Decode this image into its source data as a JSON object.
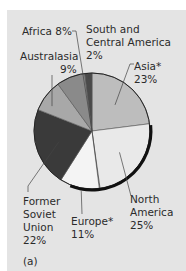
{
  "chart_data": {
    "type": "pie",
    "title": "",
    "panel_label": "(a)",
    "slices": [
      {
        "label": "Asia*",
        "value": 23,
        "display": "23%",
        "color": "#bdbdbd"
      },
      {
        "label": "North America",
        "value": 25,
        "display": "25%",
        "color": "#e9e9e9"
      },
      {
        "label": "Europe*",
        "value": 11,
        "display": "11%",
        "color": "#f4f4f4"
      },
      {
        "label": "Former Soviet Union",
        "value": 22,
        "display": "22%",
        "color": "#3a3a3a"
      },
      {
        "label": "Australasia",
        "value": 9,
        "display": "9%",
        "color": "#a8a8a8"
      },
      {
        "label": "Africa",
        "value": 8,
        "display": "8%",
        "color": "#8a8a8a"
      },
      {
        "label": "South and Central America",
        "value": 2,
        "display": "2%",
        "color": "#4a4a4a"
      }
    ],
    "start_angle_deg": 0,
    "direction": "clockwise",
    "legend": "none (callout labels)"
  },
  "labels": {
    "africa": "Africa 8%",
    "sca_1": "South and",
    "sca_2": "Central America",
    "sca_3": "2%",
    "australasia_1": "Australasia",
    "australasia_2": "9%",
    "asia_1": "Asia*",
    "asia_2": "23%",
    "fsu_1": "Former",
    "fsu_2": "Soviet",
    "fsu_3": "Union",
    "fsu_4": "22%",
    "europe_1": "Europe*",
    "europe_2": "11%",
    "na_1": "North",
    "na_2": "America",
    "na_3": "25%",
    "panel": "(a)"
  }
}
